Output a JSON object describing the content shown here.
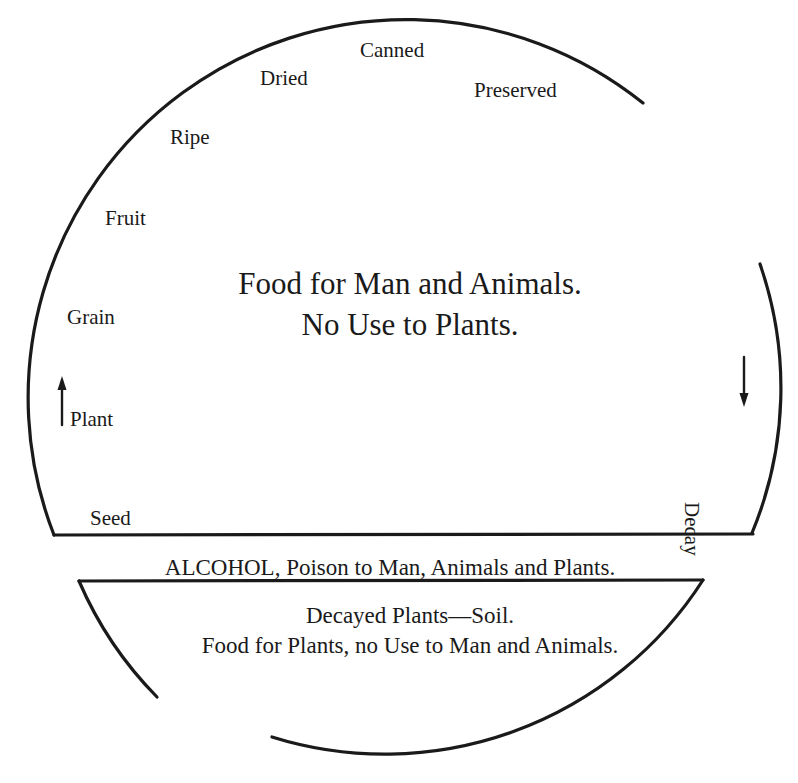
{
  "diagram": {
    "cycle_stages": [
      {
        "id": "seed",
        "label": "Seed"
      },
      {
        "id": "plant",
        "label": "Plant"
      },
      {
        "id": "grain",
        "label": "Grain"
      },
      {
        "id": "fruit",
        "label": "Fruit"
      },
      {
        "id": "ripe",
        "label": "Ripe"
      },
      {
        "id": "dried",
        "label": "Dried"
      },
      {
        "id": "canned",
        "label": "Canned"
      },
      {
        "id": "preserved",
        "label": "Preserved"
      },
      {
        "id": "decay",
        "label": "Decay"
      }
    ],
    "upper_region": {
      "line1": "Food for Man and Animals.",
      "line2": "No Use to Plants."
    },
    "middle_band": {
      "text": "ALCOHOL, Poison to Man, Animals and Plants."
    },
    "lower_region": {
      "line1": "Decayed Plants—Soil.",
      "line2": "Food for Plants, no Use to Man and Animals."
    },
    "arrows": [
      {
        "id": "arrow-up-plant",
        "direction": "up"
      },
      {
        "id": "arrow-down-right",
        "direction": "down"
      }
    ],
    "colors": {
      "ink": "#1a1a1a",
      "paper": "#ffffff"
    }
  }
}
